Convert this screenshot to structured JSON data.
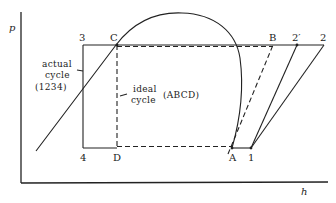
{
  "diagram": {
    "type": "pressure-enthalpy refrigeration cycle",
    "axes": {
      "y_label": "p",
      "x_label": "h"
    },
    "points": {
      "p3": "3",
      "pC": "C",
      "pB": "B",
      "p2prime": "2′",
      "p2": "2",
      "p4": "4",
      "pD": "D",
      "pA": "A",
      "p1": "1"
    },
    "annotations": {
      "actual_line1": "actual",
      "actual_line2": "cycle",
      "actual_line3": "(1234)",
      "ideal_line1": "ideal",
      "ideal_line2": "cycle",
      "ideal_suffix": "(ABCD)"
    },
    "cycles": [
      {
        "name": "actual cycle",
        "path": [
          "1",
          "2",
          "3",
          "4"
        ],
        "style": "solid"
      },
      {
        "name": "ideal cycle",
        "path": [
          "A",
          "B",
          "C",
          "D"
        ],
        "style": "dashed"
      }
    ],
    "colors": {
      "ink": "#222222",
      "background": "#ffffff"
    }
  }
}
